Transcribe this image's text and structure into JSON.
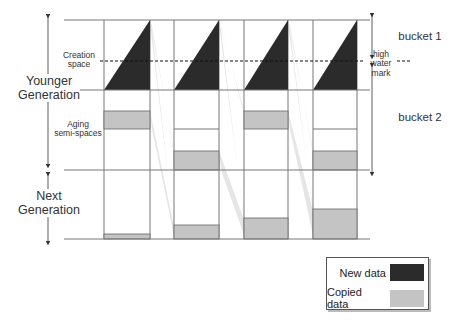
{
  "labels": {
    "younger_generation": "Younger\nGeneration",
    "next_generation": "Next\nGeneration",
    "creation_space": "Creation\nspace",
    "aging_semi_spaces": "Aging\nsemi-spaces",
    "high_water_mark": "high\nwater\nmark",
    "bucket1": "bucket 1",
    "bucket2": "bucket 2"
  },
  "legend": {
    "items": [
      {
        "label": "New data",
        "color": "#2b2b2b"
      },
      {
        "label": "Copied data",
        "color": "#c4c4c4"
      }
    ]
  },
  "colors": {
    "new_data": "#2b2b2b",
    "copied_data": "#c4c4c4",
    "copy_path": "#e2e2e2",
    "line": "#777777"
  },
  "layout": {
    "top_y": 20,
    "hwm_y": 61,
    "creation_bottom_y": 90,
    "younger_bottom_y": 170,
    "next_bottom_y": 239,
    "line_left_x": 64,
    "line_right_x": 372
  },
  "columns": [
    {
      "x": 104,
      "w": 46,
      "aging_divider_y": null,
      "aging_box": [
        111,
        129
      ],
      "next_box": [
        234,
        239
      ]
    },
    {
      "x": 174,
      "w": 45,
      "aging_divider_y": 129,
      "aging_box": [
        151,
        170
      ],
      "next_box": [
        225,
        239
      ]
    },
    {
      "x": 244,
      "w": 44,
      "aging_divider_y": null,
      "aging_box": [
        111,
        129
      ],
      "next_box": [
        218,
        239
      ]
    },
    {
      "x": 313,
      "w": 44,
      "aging_divider_y": 129,
      "aging_box": [
        151,
        170
      ],
      "next_box": [
        209,
        239
      ]
    }
  ]
}
